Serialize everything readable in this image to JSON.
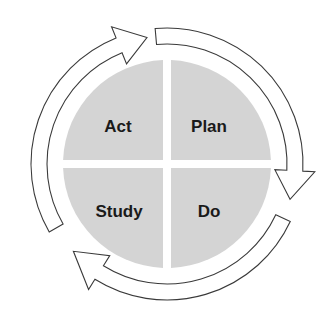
{
  "diagram": {
    "center": {
      "x": 167,
      "y": 164
    },
    "colors": {
      "background": "#ffffff",
      "quadrant_fill": "#d4d4d4",
      "arrow_stroke": "#3a3a3a",
      "label_text": "#1a1a1a"
    },
    "quadrants": [
      {
        "id": "act",
        "label": "Act",
        "position": "top-left"
      },
      {
        "id": "plan",
        "label": "Plan",
        "position": "top-right"
      },
      {
        "id": "study",
        "label": "Study",
        "position": "bottom-left"
      },
      {
        "id": "do",
        "label": "Do",
        "position": "bottom-right"
      }
    ],
    "cycle_arrows": [
      {
        "id": "arrow-act-to-plan",
        "from": "Act",
        "to": "Plan",
        "direction": "clockwise"
      },
      {
        "id": "arrow-plan-to-do",
        "from": "Plan",
        "to": "Do",
        "direction": "clockwise"
      },
      {
        "id": "arrow-do-to-study",
        "from": "Do",
        "to": "Study",
        "direction": "clockwise"
      }
    ]
  }
}
